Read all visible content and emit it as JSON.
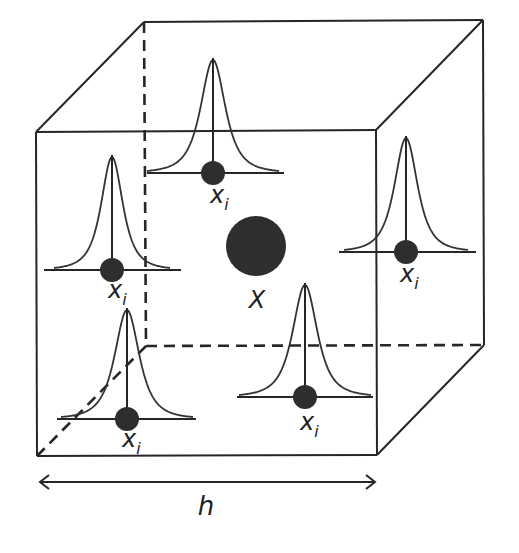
{
  "diagram": {
    "title": "",
    "center_point": {
      "label": "X",
      "x": 256,
      "y": 246,
      "r": 30,
      "label_x": 257,
      "label_y": 308
    },
    "kernels": [
      {
        "id": "top",
        "label": "x",
        "sub": "i",
        "cx": 213,
        "baseline_y": 173,
        "peak_y": 60,
        "half_width": 66,
        "base_x1": 147,
        "base_x2": 284,
        "label_x": 210,
        "label_y": 203
      },
      {
        "id": "left",
        "label": "x",
        "sub": "i",
        "cx": 112,
        "baseline_y": 270,
        "peak_y": 157,
        "half_width": 58,
        "base_x1": 44,
        "base_x2": 181,
        "label_x": 108,
        "label_y": 298
      },
      {
        "id": "right",
        "label": "x",
        "sub": "i",
        "cx": 406,
        "baseline_y": 252,
        "peak_y": 138,
        "half_width": 62,
        "base_x1": 339,
        "base_x2": 476,
        "label_x": 400,
        "label_y": 282
      },
      {
        "id": "bottom-left",
        "label": "x",
        "sub": "i",
        "cx": 127,
        "baseline_y": 419,
        "peak_y": 310,
        "half_width": 66,
        "base_x1": 57,
        "base_x2": 196,
        "label_x": 122,
        "label_y": 447
      },
      {
        "id": "bottom-right",
        "label": "x",
        "sub": "i",
        "cx": 305,
        "baseline_y": 397,
        "peak_y": 285,
        "half_width": 66,
        "base_x1": 237,
        "base_x2": 373,
        "label_x": 300,
        "label_y": 430
      }
    ],
    "cube": {
      "front": {
        "tl": [
          36,
          132
        ],
        "tr": [
          376,
          130
        ],
        "br": [
          377,
          455
        ],
        "bl": [
          37,
          456
        ]
      },
      "back": {
        "tl": [
          144,
          22
        ],
        "tr": [
          483,
          20
        ],
        "br": [
          484,
          345
        ],
        "bl": [
          146,
          346
        ]
      }
    },
    "dimension": {
      "label": "h",
      "x1": 40,
      "x2": 375,
      "y": 482,
      "label_x": 206,
      "label_y": 515
    }
  }
}
